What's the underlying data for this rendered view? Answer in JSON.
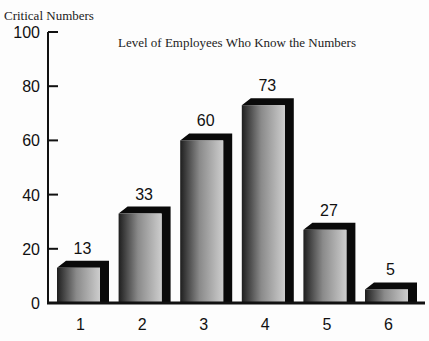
{
  "chart_data": {
    "type": "bar",
    "title": "Level of Employees Who Know the Numbers",
    "ylabel": "Critical Numbers",
    "xlabel": "",
    "categories": [
      "1",
      "2",
      "3",
      "4",
      "5",
      "6"
    ],
    "values": [
      13,
      33,
      60,
      73,
      27,
      5
    ],
    "ylim": [
      0,
      100
    ],
    "yticks": [
      0,
      20,
      40,
      60,
      80,
      100
    ],
    "grid": false,
    "legend": null,
    "style": "3d-gradient-bars",
    "data_labels": true
  },
  "colors": {
    "bar_dark": "#1a1a1a",
    "bar_light": "#c8c8c8",
    "depth": "#0a0a0a",
    "axis": "#111111",
    "background": "#fdfdfd"
  }
}
